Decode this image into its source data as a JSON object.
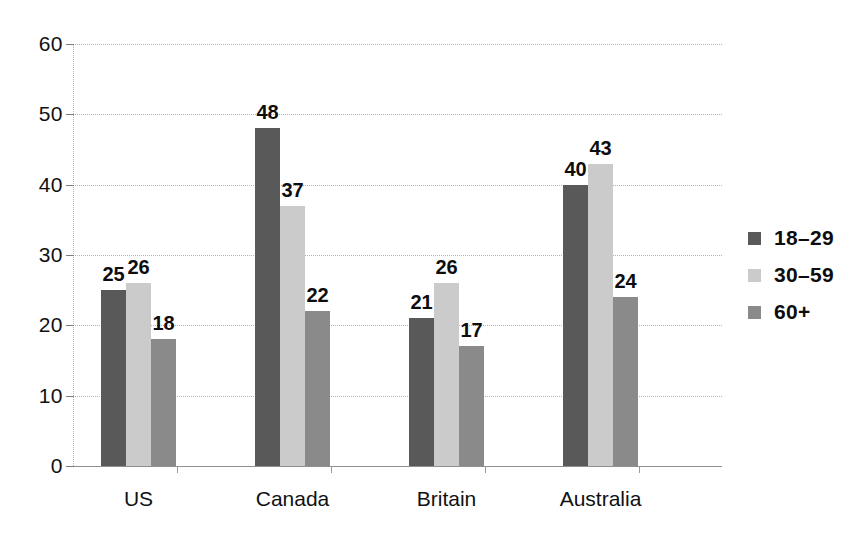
{
  "chart_data": {
    "type": "bar",
    "title": "",
    "subtitle": "",
    "xlabel": "",
    "ylabel": "",
    "ylim": [
      0,
      60
    ],
    "ytick_step": 10,
    "yticks": [
      "0",
      "10",
      "20",
      "30",
      "40",
      "50",
      "60"
    ],
    "grid": true,
    "grid_style": "dotted-horizontal",
    "legend_position": "right",
    "categories": [
      "US",
      "Canada",
      "Britain",
      "Australia"
    ],
    "series": [
      {
        "name": "18–29",
        "color": "#595959",
        "values": [
          25,
          26,
          21,
          40
        ]
      },
      {
        "name": "30–59",
        "color": "#cbcbcb",
        "values": [
          26,
          37,
          26,
          43
        ]
      },
      {
        "name": "60+",
        "color": "#8a8a8a",
        "values": [
          18,
          22,
          17,
          24
        ]
      }
    ],
    "bar_labels": [
      [
        25,
        26,
        18
      ],
      [
        48,
        37,
        22
      ],
      [
        21,
        26,
        17
      ],
      [
        40,
        43,
        24
      ]
    ],
    "annotations": {
      "canada_18_29": 48,
      "note": "Bar value labels are drawn above each bar"
    }
  },
  "colors": {
    "background": "#ffffff",
    "axis": "#8f8f8f",
    "grid": "#b4b4b4",
    "text": "#111111",
    "series_dark": "#595959",
    "series_light": "#cbcbcb",
    "series_medium": "#8a8a8a"
  },
  "legend": {
    "items": [
      {
        "label": "18–29",
        "color": "#595959"
      },
      {
        "label": "30–59",
        "color": "#cbcbcb"
      },
      {
        "label": "60+",
        "color": "#8a8a8a"
      }
    ]
  },
  "axis": {
    "y_labels": [
      "60",
      "50",
      "40",
      "30",
      "20",
      "10",
      "0"
    ],
    "x_labels": [
      "US",
      "Canada",
      "Britain",
      "Australia"
    ]
  }
}
